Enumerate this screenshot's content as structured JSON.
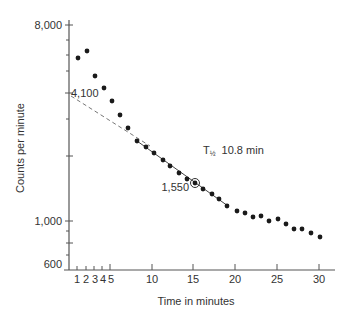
{
  "chart_data": {
    "type": "scatter",
    "title": "",
    "xlabel": "Time in minutes",
    "ylabel": "Counts per minute",
    "y_scale": "log",
    "ylim": [
      600,
      8000
    ],
    "xlim": [
      0,
      31
    ],
    "grid": false,
    "legend": null,
    "x_ticks": [
      1,
      2,
      3,
      4,
      5,
      10,
      15,
      20,
      25,
      30
    ],
    "x_tick_labels": [
      "1",
      "2",
      "3",
      "4",
      "5",
      "10",
      "15",
      "20",
      "25",
      "30"
    ],
    "y_tick_labels": [
      {
        "label": "8,000",
        "value": 8000
      },
      {
        "label": "4,100",
        "value": 4100
      },
      {
        "label": "1,000",
        "value": 1000
      },
      {
        "label": "600",
        "value": 600
      }
    ],
    "series": [
      {
        "name": "Measured counts",
        "x": [
          1,
          2,
          3,
          4,
          5,
          6,
          7,
          8,
          9,
          10,
          11,
          12,
          13,
          14,
          15,
          16,
          17,
          18,
          19,
          20,
          21,
          22,
          23,
          24,
          25,
          26,
          27,
          28,
          29,
          30
        ],
        "y": [
          5930,
          6400,
          4860,
          4270,
          3710,
          3200,
          2780,
          2420,
          2270,
          2130,
          1980,
          1860,
          1730,
          1620,
          1550,
          1450,
          1380,
          1310,
          1210,
          1150,
          1120,
          1080,
          1090,
          1030,
          1050,
          1000,
          940,
          940,
          900,
          860
        ]
      }
    ],
    "fit_lines": [
      {
        "name": "Extrapolated back to t=0",
        "style": "dashed",
        "from": {
          "x": 0,
          "y": 4100
        },
        "to": {
          "x": 10,
          "y": 2130
        }
      },
      {
        "name": "Exponential fit",
        "style": "solid",
        "from": {
          "x": 8,
          "y": 2420
        },
        "to": {
          "x": 20,
          "y": 1150
        }
      }
    ],
    "annotations": [
      {
        "text": "4,100",
        "x": 0,
        "y": 4100,
        "note": "y-intercept of extrapolated line"
      },
      {
        "text": "1,550",
        "x": 15,
        "y": 1550,
        "note": "circled point"
      },
      {
        "text": "T½ 10.8 min",
        "x": 18,
        "y": 2300,
        "note": "half-life"
      }
    ]
  },
  "labels": {
    "y_axis_title": "Counts per minute",
    "x_axis_title": "Time in minutes",
    "y_8000": "8,000",
    "y_4100": "4,100",
    "y_1000": "1,000",
    "y_600": "600",
    "x1": "1",
    "x2": "2",
    "x3": "3",
    "x4": "4",
    "x5": "5",
    "x10": "10",
    "x15": "15",
    "x20": "20",
    "x25": "25",
    "x30": "30",
    "half_life_symbol": "T",
    "half_life_sub": "½",
    "half_life_value": "10.8 min",
    "circled_value": "1,550"
  },
  "dots_px": [
    [
      78,
      58
    ],
    [
      87,
      51
    ],
    [
      95,
      76
    ],
    [
      104,
      88
    ],
    [
      112,
      101
    ],
    [
      120,
      115
    ],
    [
      128,
      128
    ],
    [
      137,
      141
    ],
    [
      146,
      147
    ],
    [
      154,
      153
    ],
    [
      163,
      160
    ],
    [
      170,
      166
    ],
    [
      179,
      173
    ],
    [
      187,
      179
    ],
    [
      195,
      183
    ],
    [
      203,
      189
    ],
    [
      212,
      194
    ],
    [
      219,
      199
    ],
    [
      227,
      206
    ],
    [
      237,
      211
    ],
    [
      245,
      213
    ],
    [
      253,
      217
    ],
    [
      261,
      216
    ],
    [
      269,
      221
    ],
    [
      278,
      219
    ],
    [
      286,
      224
    ],
    [
      294,
      229
    ],
    [
      302,
      229
    ],
    [
      311,
      233
    ],
    [
      320,
      237
    ]
  ]
}
